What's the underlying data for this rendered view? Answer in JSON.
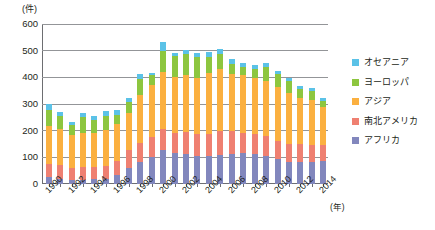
{
  "chart_data": {
    "type": "bar",
    "stacked": true,
    "title": "",
    "unit_label": "(件)",
    "xlabel": "(年)",
    "ylabel": "",
    "ylim": [
      0,
      600
    ],
    "yticks": [
      0,
      100,
      200,
      300,
      400,
      500,
      600
    ],
    "grid": true,
    "legend_position": "right",
    "categories": [
      "1990",
      "1991",
      "1992",
      "1993",
      "1994",
      "1995",
      "1996",
      "1997",
      "1998",
      "1999",
      "2000",
      "2001",
      "2002",
      "2003",
      "2004",
      "2005",
      "2006",
      "2007",
      "2008",
      "2009",
      "2010",
      "2011",
      "2012",
      "2013",
      "2014"
    ],
    "tick_labels": [
      "1990",
      "1992",
      "1994",
      "1996",
      "1998",
      "2000",
      "2002",
      "2004",
      "2006",
      "2008",
      "2010",
      "2012",
      "2014"
    ],
    "series": [
      {
        "name": "アフリカ",
        "color": "#8287bd",
        "values": [
          27,
          19,
          16,
          16,
          18,
          20,
          32,
          60,
          82,
          103,
          128,
          117,
          113,
          106,
          106,
          110,
          114,
          115,
          111,
          105,
          93,
          83,
          84,
          84,
          86
        ]
      },
      {
        "name": "南北アメリカ",
        "color": "#ef8071",
        "values": [
          48,
          52,
          45,
          46,
          44,
          48,
          56,
          68,
          73,
          74,
          78,
          74,
          82,
          83,
          81,
          87,
          84,
          76,
          77,
          75,
          68,
          66,
          65,
          62,
          60
        ]
      },
      {
        "name": "アジア",
        "color": "#fbb040",
        "values": [
          143,
          136,
          121,
          128,
          131,
          134,
          136,
          140,
          180,
          195,
          214,
          211,
          213,
          210,
          229,
          233,
          213,
          216,
          209,
          207,
          203,
          192,
          172,
          169,
          143
        ]
      },
      {
        "name": "ヨーロッパ",
        "color": "#8dc63f",
        "values": [
          58,
          48,
          38,
          60,
          48,
          54,
          35,
          39,
          58,
          37,
          80,
          80,
          80,
          78,
          62,
          58,
          41,
          32,
          34,
          50,
          49,
          45,
          34,
          34,
          24
        ]
      },
      {
        "name": "オセアニア",
        "color": "#5bc2e7",
        "values": [
          26,
          16,
          11,
          17,
          15,
          18,
          18,
          16,
          20,
          7,
          31,
          10,
          15,
          13,
          18,
          19,
          17,
          16,
          16,
          15,
          12,
          10,
          11,
          10,
          10
        ]
      }
    ],
    "totals": [
      302,
      271,
      231,
      267,
      256,
      274,
      277,
      323,
      413,
      416,
      531,
      492,
      503,
      490,
      496,
      507,
      469,
      455,
      447,
      452,
      425,
      396,
      366,
      359,
      323
    ]
  },
  "legend": {
    "items": [
      {
        "label": "オセアニア",
        "color": "#5bc2e7"
      },
      {
        "label": "ヨーロッパ",
        "color": "#8dc63f"
      },
      {
        "label": "アジア",
        "color": "#fbb040"
      },
      {
        "label": "南北アメリカ",
        "color": "#ef8071"
      },
      {
        "label": "アフリカ",
        "color": "#8287bd"
      }
    ]
  }
}
